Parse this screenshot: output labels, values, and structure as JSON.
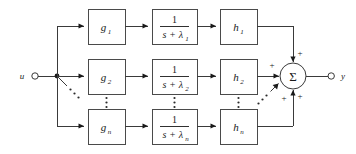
{
  "diagram": {
    "input": {
      "label": "u",
      "terminal": "input-terminal"
    },
    "output": {
      "label": "y",
      "terminal": "output-terminal"
    },
    "summing_junction": {
      "symbol": "Σ",
      "signs": [
        "+",
        "+",
        "+",
        "+"
      ]
    },
    "rows": [
      {
        "id": "row-1",
        "gain": {
          "base": "g",
          "sub": "1"
        },
        "transfer": {
          "numerator": "1",
          "den_lead": "s",
          "den_op": "+",
          "den_sym": "λ",
          "den_sub": "1"
        },
        "output_block": {
          "base": "h",
          "sub": "1"
        }
      },
      {
        "id": "row-2",
        "gain": {
          "base": "g",
          "sub": "2"
        },
        "transfer": {
          "numerator": "1",
          "den_lead": "s",
          "den_op": "+",
          "den_sym": "λ",
          "den_sub": "2"
        },
        "output_block": {
          "base": "h",
          "sub": "2"
        }
      },
      {
        "id": "row-n",
        "gain": {
          "base": "g",
          "sub": "n"
        },
        "transfer": {
          "numerator": "1",
          "den_lead": "s",
          "den_op": "+",
          "den_sym": "λ",
          "den_sub": "n"
        },
        "output_block": {
          "base": "h",
          "sub": "n"
        }
      }
    ],
    "ellipses": [
      {
        "name": "ellipsis-input-branch",
        "orientation": "diagonal"
      },
      {
        "name": "ellipsis-gain-column",
        "orientation": "vertical"
      },
      {
        "name": "ellipsis-transfer-column",
        "orientation": "vertical"
      },
      {
        "name": "ellipsis-output-column",
        "orientation": "vertical"
      },
      {
        "name": "ellipsis-sum-branch",
        "orientation": "diagonal"
      }
    ],
    "colors": {
      "line": "#3a3a3a",
      "box_stroke": "#4a4a4a",
      "text": "#1a1a1a",
      "background": "#ffffff"
    }
  }
}
